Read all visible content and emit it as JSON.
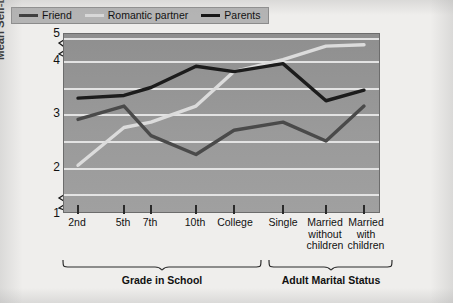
{
  "chart_data": {
    "type": "line",
    "title": "",
    "xlabel": "",
    "ylabel": "Mean Self-Disclosure Score",
    "ylim": [
      1,
      5
    ],
    "yticks": [
      1,
      2,
      3,
      4,
      5
    ],
    "grid": true,
    "legend_position": "top-left-inside",
    "axis_breaks": [
      "between 1 and 2",
      "between 4 and 5"
    ],
    "categories": [
      "2nd",
      "5th",
      "7th",
      "10th",
      "College",
      "Single",
      "Married without children",
      "Married with children"
    ],
    "category_groups": [
      {
        "label": "Grade in School",
        "categories": [
          "2nd",
          "5th",
          "7th",
          "10th",
          "College"
        ]
      },
      {
        "label": "Adult Marital Status",
        "categories": [
          "Single",
          "Married without children",
          "Married with children"
        ]
      }
    ],
    "series": [
      {
        "name": "Friend",
        "color": "#4a4a4a",
        "values": [
          2.9,
          3.15,
          2.6,
          2.25,
          2.7,
          2.85,
          2.5,
          3.15
        ]
      },
      {
        "name": "Romantic partner",
        "color": "#dcdcdc",
        "values": [
          2.05,
          2.75,
          2.85,
          3.15,
          3.8,
          4.05,
          4.55,
          4.6
        ]
      },
      {
        "name": "Parents",
        "color": "#1c1c1c",
        "values": [
          3.3,
          3.35,
          3.5,
          3.9,
          3.8,
          3.95,
          3.25,
          3.45
        ]
      }
    ]
  },
  "axis": {
    "y_title": "Mean Self-Disclosure Score",
    "y_tick_labels": [
      "5",
      "4",
      "3",
      "2",
      "1"
    ],
    "x_tick_labels": [
      "2nd",
      "5th",
      "7th",
      "10th",
      "College",
      "Single",
      "Married without children",
      "Married with children"
    ]
  },
  "legend": {
    "items": [
      {
        "label": "Friend",
        "color": "#4a4a4a"
      },
      {
        "label": "Romantic partner",
        "color": "#dcdcdc"
      },
      {
        "label": "Parents",
        "color": "#1c1c1c"
      }
    ]
  },
  "brackets": [
    {
      "label": "Grade in School"
    },
    {
      "label": "Adult Marital Status"
    }
  ]
}
